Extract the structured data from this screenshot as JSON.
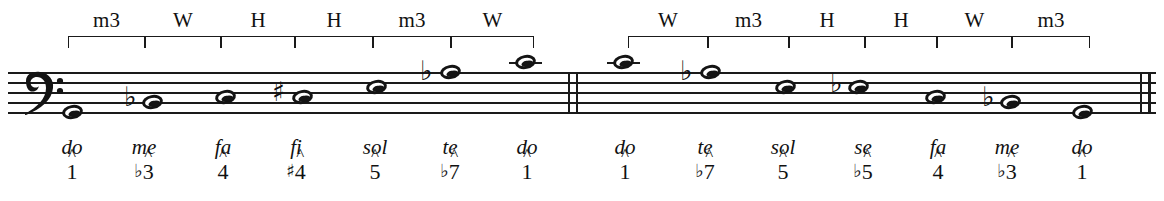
{
  "figure": {
    "type": "music-notation",
    "clef": "bass-clef",
    "measures": 2,
    "barlines": [
      "double-barline-middle",
      "final-double-barline"
    ]
  },
  "intervals": {
    "ascending": [
      {
        "label": "m3",
        "index": 0
      },
      {
        "label": "W",
        "index": 1
      },
      {
        "label": "H",
        "index": 2
      },
      {
        "label": "H",
        "index": 3
      },
      {
        "label": "m3",
        "index": 4
      },
      {
        "label": "W",
        "index": 5
      }
    ],
    "descending": [
      {
        "label": "W",
        "index": 0
      },
      {
        "label": "m3",
        "index": 1
      },
      {
        "label": "H",
        "index": 2
      },
      {
        "label": "H",
        "index": 3
      },
      {
        "label": "W",
        "index": 4
      },
      {
        "label": "m3",
        "index": 5
      }
    ]
  },
  "notes_ascending": [
    {
      "syllable": "do",
      "degree": "1",
      "accidental": "",
      "degree_accidental": ""
    },
    {
      "syllable": "me",
      "degree": "3",
      "accidental": "♭",
      "degree_accidental": "♭"
    },
    {
      "syllable": "fa",
      "degree": "4",
      "accidental": "",
      "degree_accidental": ""
    },
    {
      "syllable": "fi",
      "degree": "4",
      "accidental": "♯",
      "degree_accidental": "♯"
    },
    {
      "syllable": "sol",
      "degree": "5",
      "accidental": "",
      "degree_accidental": ""
    },
    {
      "syllable": "te",
      "degree": "7",
      "accidental": "♭",
      "degree_accidental": "♭"
    },
    {
      "syllable": "do",
      "degree": "1",
      "accidental": "",
      "degree_accidental": ""
    }
  ],
  "notes_descending": [
    {
      "syllable": "do",
      "degree": "1",
      "accidental": "",
      "degree_accidental": ""
    },
    {
      "syllable": "te",
      "degree": "7",
      "accidental": "♭",
      "degree_accidental": "♭"
    },
    {
      "syllable": "sol",
      "degree": "5",
      "accidental": "",
      "degree_accidental": ""
    },
    {
      "syllable": "se",
      "degree": "5",
      "accidental": "♭",
      "degree_accidental": "♭"
    },
    {
      "syllable": "fa",
      "degree": "4",
      "accidental": "",
      "degree_accidental": ""
    },
    {
      "syllable": "me",
      "degree": "3",
      "accidental": "♭",
      "degree_accidental": "♭"
    },
    {
      "syllable": "do",
      "degree": "1",
      "accidental": "",
      "degree_accidental": ""
    }
  ],
  "colors": {
    "ink": "#1a1a1a",
    "paper": "#ffffff"
  }
}
